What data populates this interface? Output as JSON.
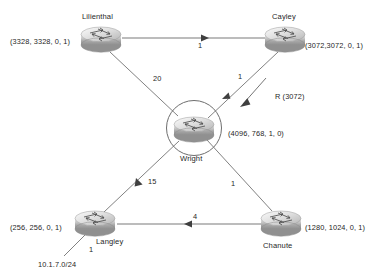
{
  "diagram": {
    "background_color": "#ffffff",
    "link_color": "#6e6e6e",
    "text_color": "#262626",
    "nodes": [
      {
        "id": "lilienthal",
        "name": "Lilienthal",
        "attributes": "(3328, 3328, 0, 1)",
        "x": 101,
        "y": 38,
        "name_x": 82,
        "name_y": 13,
        "attr_x": 10,
        "attr_y": 38,
        "circled": false
      },
      {
        "id": "cayley",
        "name": "Cayley",
        "attributes": "(3072,3072, 0, 1)",
        "x": 285,
        "y": 38,
        "name_x": 272,
        "name_y": 13,
        "attr_x": 305,
        "attr_y": 42,
        "circled": false
      },
      {
        "id": "wright",
        "name": "Wright",
        "attributes": "(4096, 768, 1, 0)",
        "x": 194,
        "y": 128,
        "name_x": 180,
        "name_y": 155,
        "attr_x": 228,
        "attr_y": 130,
        "circled": true
      },
      {
        "id": "langley",
        "name": "Langley",
        "attributes": "(256, 256, 0, 1)",
        "x": 95,
        "y": 222,
        "name_x": 96,
        "name_y": 238,
        "attr_x": 10,
        "attr_y": 224,
        "circled": false
      },
      {
        "id": "chanute",
        "name": "Chanute",
        "attributes": "(1280, 1024, 0, 1)",
        "x": 281,
        "y": 222,
        "name_x": 263,
        "name_y": 242,
        "attr_x": 305,
        "attr_y": 224,
        "circled": false
      }
    ],
    "links": [
      {
        "id": "lilienthal-cayley",
        "from": "lilienthal",
        "to": "cayley",
        "cost": "1",
        "cost_x": 198,
        "cost_y": 42,
        "arrow_direction": "right"
      },
      {
        "id": "lilienthal-wright",
        "from": "lilienthal",
        "to": "wright",
        "cost": "20",
        "cost_x": 153,
        "cost_y": 75,
        "arrow_direction": "none"
      },
      {
        "id": "cayley-wright",
        "from": "cayley",
        "to": "wright",
        "cost": "1",
        "cost_x": 238,
        "cost_y": 73,
        "arrow_direction": "down-left"
      },
      {
        "id": "wright-chanute",
        "from": "wright",
        "to": "chanute",
        "cost": "1",
        "cost_x": 231,
        "cost_y": 180,
        "arrow_direction": "none"
      },
      {
        "id": "langley-wright",
        "from": "langley",
        "to": "wright",
        "cost": "15",
        "cost_x": 148,
        "cost_y": 178,
        "arrow_direction": "up-right"
      },
      {
        "id": "chanute-langley",
        "from": "chanute",
        "to": "langley",
        "cost": "4",
        "cost_x": 193,
        "cost_y": 213,
        "arrow_direction": "left"
      },
      {
        "id": "langley-stub",
        "from": "langley",
        "to": "stub-network",
        "cost": "1",
        "cost_x": 89,
        "cost_y": 246,
        "arrow_direction": "none"
      }
    ],
    "stub_network": {
      "id": "stub-network",
      "label": "10.1.7.0/24",
      "x": 38,
      "y": 261
    },
    "annotation": {
      "id": "route-annotation",
      "label": "R (3072)",
      "x": 275,
      "y": 93,
      "arrow_from_x": 266,
      "arrow_from_y": 78,
      "arrow_to_x": 240,
      "arrow_to_y": 107
    }
  }
}
